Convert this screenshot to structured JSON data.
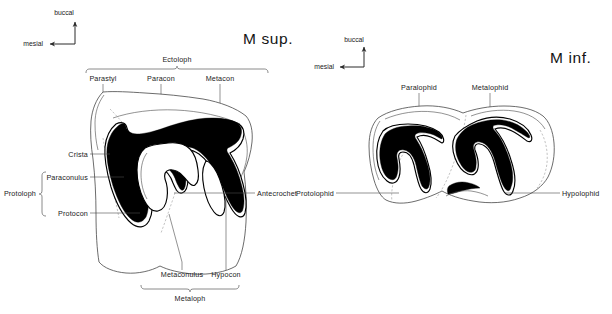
{
  "figure": {
    "background_color": "#ffffff",
    "ink_color": "#000000",
    "line_color": "#3b3b3b",
    "dashed_color": "#9a9a9a"
  },
  "upper_molar": {
    "title": "M sup.",
    "orientation": {
      "vertical_label": "buccal",
      "horizontal_label": "mesial",
      "vertical_arrow_icon": "arrow-up-icon",
      "horizontal_arrow_icon": "arrow-left-icon"
    },
    "brackets": {
      "top": "Ectoloph",
      "bottom": "Metaloph",
      "left": "Protoloph"
    },
    "labels": {
      "parastyl": "Parastyl",
      "paracon": "Paracon",
      "metacon": "Metacon",
      "crista": "Crista",
      "paraconulus": "Paraconulus",
      "protocon": "Protocon",
      "antecrochet": "Antecrochet",
      "metaconulus": "Metaconulus",
      "hypocon": "Hypocon"
    }
  },
  "lower_molar": {
    "title": "M inf.",
    "orientation": {
      "vertical_label": "buccal",
      "horizontal_label": "mesial",
      "vertical_arrow_icon": "arrow-up-icon",
      "horizontal_arrow_icon": "arrow-left-icon"
    },
    "labels": {
      "paralophid": "Paralophid",
      "metalophid": "Metalophid",
      "protolophid": "Protolophid",
      "hypolophid": "Hypolophid"
    }
  }
}
